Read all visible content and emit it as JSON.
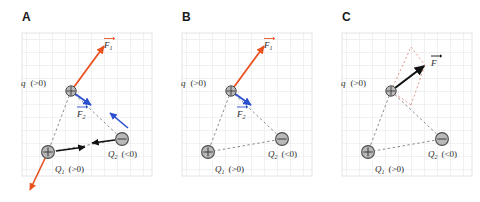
{
  "figure": {
    "background_color": "#ffffff",
    "width": 480,
    "height": 202
  },
  "style": {
    "grid_color": "#e4e4e8",
    "grid_spacing": 13,
    "force_f1_color": "#e8501e",
    "force_f2_color": "#2a4fd0",
    "resultant_color": "#111111",
    "dashed_line_color": "#6e6e6e",
    "construction_color": "#d98a7a",
    "charge_fill": "#b9b9b9",
    "charge_stroke": "#4a4a4a",
    "label_color": "#2b2b2b",
    "panel_letter_color": "#1a1a1a"
  },
  "panels": [
    {
      "id": "panel-a",
      "letter": "A",
      "caption_hint": "Individual forces F1 and F2 on q, plus reaction forces on Q1 and Q2",
      "charges": [
        {
          "name": "q",
          "sign": "+",
          "symbol": "crosshair",
          "label_main": "q",
          "label_sub": "",
          "label_paren": "(>0)"
        },
        {
          "name": "Q1",
          "sign": "+",
          "symbol": "plus",
          "label_main": "Q",
          "label_sub": "1",
          "label_paren": "(>0)"
        },
        {
          "name": "Q2",
          "sign": "-",
          "symbol": "minus",
          "label_main": "Q",
          "label_sub": "2",
          "label_paren": "(<0)"
        }
      ],
      "vectors": [
        {
          "name": "F1",
          "label_main": "F",
          "label_sub": "1",
          "color": "#e8501e",
          "on": "q",
          "description": "repulsive force from Q1, pointing up-right"
        },
        {
          "name": "F2",
          "label_main": "F",
          "label_sub": "2",
          "color": "#2a4fd0",
          "on": "q",
          "description": "attractive force toward Q2, pointing down-right"
        },
        {
          "name": "reaction-on-Q1",
          "label_main": "",
          "label_sub": "",
          "color": "#e8501e",
          "on": "Q1",
          "description": "reaction force on Q1 pointing down-left"
        },
        {
          "name": "reaction-Q1-toward-Q2",
          "label_main": "",
          "label_sub": "",
          "color": "#111111",
          "on": "Q1",
          "description": "force on Q1 from Q2 pointing right"
        },
        {
          "name": "reaction-Q2-toward-Q1",
          "label_main": "",
          "label_sub": "",
          "color": "#111111",
          "on": "Q2",
          "description": "force on Q2 from Q1 pointing left"
        },
        {
          "name": "reaction-on-Q2",
          "label_main": "",
          "label_sub": "",
          "color": "#2a4fd0",
          "on": "Q2",
          "description": "reaction force on Q2 pointing up-left"
        }
      ]
    },
    {
      "id": "panel-b",
      "letter": "B",
      "caption_hint": "Only the two forces acting on the test charge q are retained",
      "charges": [
        {
          "name": "q",
          "sign": "+",
          "symbol": "crosshair",
          "label_main": "q",
          "label_sub": "",
          "label_paren": "(>0)"
        },
        {
          "name": "Q1",
          "sign": "+",
          "symbol": "plus",
          "label_main": "Q",
          "label_sub": "1",
          "label_paren": "(>0)"
        },
        {
          "name": "Q2",
          "sign": "-",
          "symbol": "minus",
          "label_main": "Q",
          "label_sub": "2",
          "label_paren": "(<0)"
        }
      ],
      "vectors": [
        {
          "name": "F1",
          "label_main": "F",
          "label_sub": "1",
          "color": "#e8501e",
          "on": "q",
          "description": "repulsive force from Q1, pointing up-right"
        },
        {
          "name": "F2",
          "label_main": "F",
          "label_sub": "2",
          "color": "#2a4fd0",
          "on": "q",
          "description": "attractive force toward Q2, pointing down-right"
        }
      ]
    },
    {
      "id": "panel-c",
      "letter": "C",
      "caption_hint": "Parallelogram construction gives the resultant force F on q",
      "charges": [
        {
          "name": "q",
          "sign": "+",
          "symbol": "crosshair",
          "label_main": "q",
          "label_sub": "",
          "label_paren": "(>0)"
        },
        {
          "name": "Q1",
          "sign": "+",
          "symbol": "plus",
          "label_main": "Q",
          "label_sub": "1",
          "label_paren": "(>0)"
        },
        {
          "name": "Q2",
          "sign": "-",
          "symbol": "minus",
          "label_main": "Q",
          "label_sub": "2",
          "label_paren": "(<0)"
        }
      ],
      "vectors": [
        {
          "name": "F",
          "label_main": "F",
          "label_sub": "",
          "color": "#111111",
          "on": "q",
          "description": "resultant of F1 and F2, pointing right and slightly up"
        }
      ],
      "construction": {
        "name": "parallelogram",
        "color": "#d98a7a",
        "dashed": true
      }
    }
  ]
}
